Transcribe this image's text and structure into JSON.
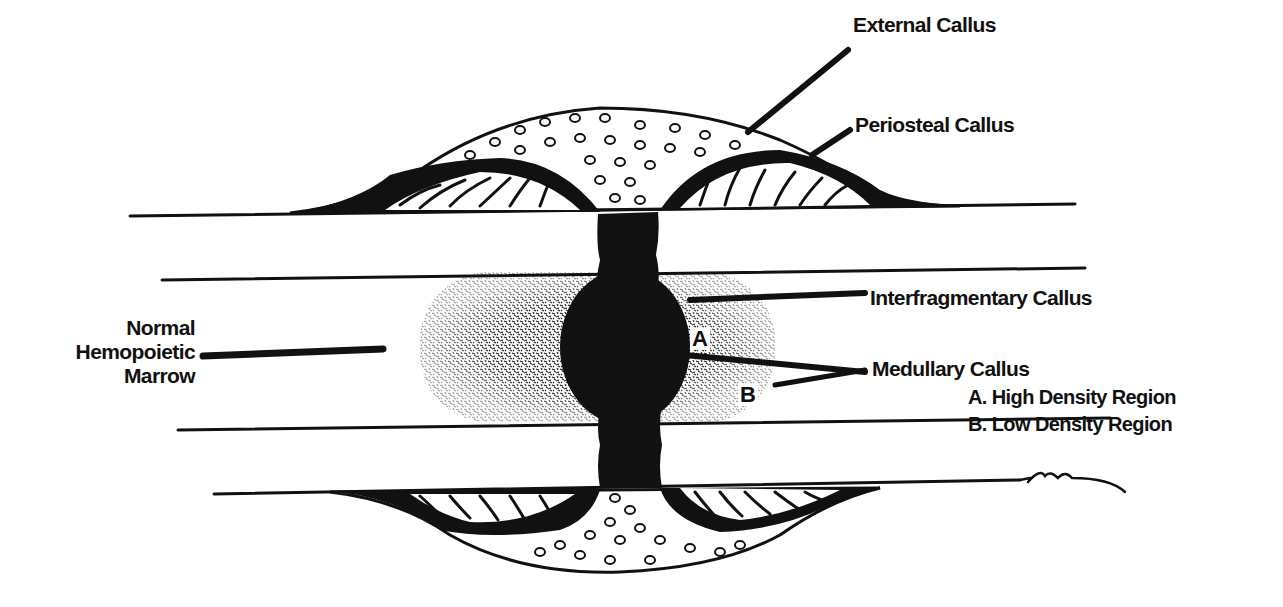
{
  "diagram": {
    "colors": {
      "ink": "#111111",
      "background": "#ffffff",
      "stipple": "#222222"
    },
    "labels": {
      "external_callus": "External Callus",
      "periosteal_callus": "Periosteal Callus",
      "interfragmentary_callus": "Interfragmentary Callus",
      "medullary_callus": "Medullary Callus",
      "high_density": "A. High Density Region",
      "low_density": "B. Low Density Region",
      "marrow_line1": "Normal",
      "marrow_line2": "Hemopoietic",
      "marrow_line3": "Marrow",
      "region_a": "A",
      "region_b": "B"
    }
  }
}
